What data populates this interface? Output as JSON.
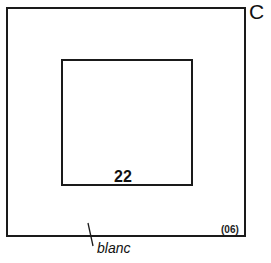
{
  "diagram": {
    "corner_label": "C",
    "inner_square_label": "22",
    "code_label": "(06)",
    "margin_annotation": "blanc"
  },
  "colors": {
    "stroke": "#1a1a1a",
    "background": "#ffffff"
  }
}
